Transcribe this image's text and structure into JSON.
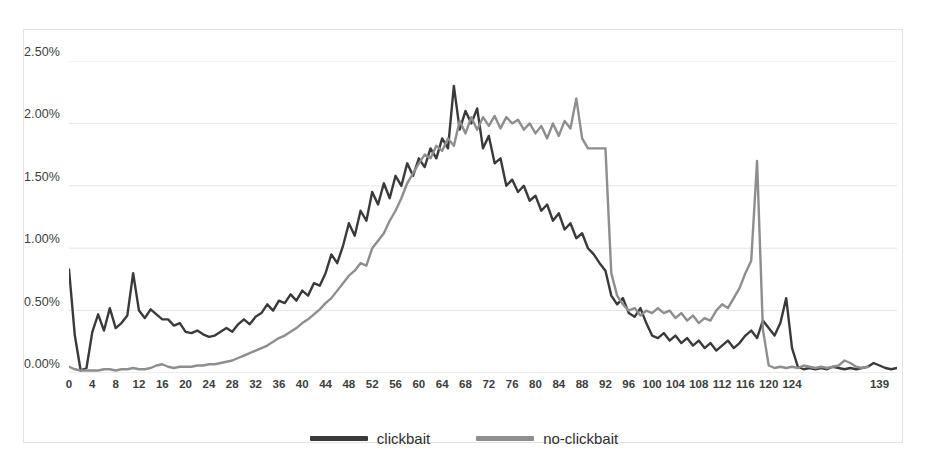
{
  "chart_data": {
    "type": "line",
    "title": "",
    "xlabel": "",
    "ylabel": "",
    "ylim": [
      0,
      2.5
    ],
    "xlim": [
      0,
      139
    ],
    "y_tick_labels": [
      "0.00%",
      "0.50%",
      "1.00%",
      "1.50%",
      "2.00%",
      "2.50%"
    ],
    "y_tick_values": [
      0,
      0.5,
      1.0,
      1.5,
      2.0,
      2.5
    ],
    "x_tick_labels": [
      "0",
      "4",
      "8",
      "12",
      "16",
      "20",
      "24",
      "28",
      "32",
      "36",
      "40",
      "44",
      "48",
      "52",
      "56",
      "60",
      "64",
      "68",
      "72",
      "76",
      "80",
      "84",
      "88",
      "92",
      "96",
      "100",
      "104",
      "108",
      "112",
      "116",
      "120",
      "124",
      "139"
    ],
    "x_tick_values": [
      0,
      4,
      8,
      12,
      16,
      20,
      24,
      28,
      32,
      36,
      40,
      44,
      48,
      52,
      56,
      60,
      64,
      68,
      72,
      76,
      80,
      84,
      88,
      92,
      96,
      100,
      104,
      108,
      112,
      116,
      120,
      124,
      139
    ],
    "grid": true,
    "legend_position": "bottom",
    "colors": {
      "clickbait": "#3a3a3a",
      "no-clickbait": "#8e8e8e"
    },
    "series": [
      {
        "name": "clickbait",
        "color": "#3a3a3a",
        "values": [
          0.83,
          0.3,
          0.02,
          0.04,
          0.33,
          0.47,
          0.34,
          0.52,
          0.36,
          0.4,
          0.46,
          0.8,
          0.5,
          0.44,
          0.51,
          0.47,
          0.43,
          0.43,
          0.38,
          0.4,
          0.33,
          0.32,
          0.34,
          0.31,
          0.29,
          0.3,
          0.33,
          0.36,
          0.33,
          0.39,
          0.43,
          0.39,
          0.45,
          0.48,
          0.55,
          0.5,
          0.58,
          0.56,
          0.63,
          0.58,
          0.66,
          0.62,
          0.72,
          0.7,
          0.8,
          0.95,
          0.88,
          1.02,
          1.2,
          1.1,
          1.3,
          1.22,
          1.45,
          1.35,
          1.52,
          1.4,
          1.58,
          1.5,
          1.68,
          1.58,
          1.72,
          1.65,
          1.8,
          1.72,
          1.88,
          1.8,
          2.3,
          1.95,
          2.1,
          2.0,
          2.12,
          1.8,
          1.9,
          1.68,
          1.72,
          1.5,
          1.55,
          1.45,
          1.5,
          1.38,
          1.42,
          1.3,
          1.35,
          1.22,
          1.28,
          1.15,
          1.2,
          1.08,
          1.12,
          1.0,
          0.95,
          0.88,
          0.82,
          0.62,
          0.55,
          0.6,
          0.48,
          0.45,
          0.52,
          0.4,
          0.3,
          0.28,
          0.32,
          0.26,
          0.3,
          0.24,
          0.28,
          0.22,
          0.26,
          0.2,
          0.24,
          0.18,
          0.22,
          0.26,
          0.2,
          0.24,
          0.3,
          0.34,
          0.28,
          0.42,
          0.36,
          0.3,
          0.4,
          0.6,
          0.2,
          0.05,
          0.03,
          0.04,
          0.03,
          0.04,
          0.03,
          0.05,
          0.04,
          0.03,
          0.04,
          0.03,
          0.04,
          0.05,
          0.08,
          0.06,
          0.04,
          0.03,
          0.04
        ]
      },
      {
        "name": "no-clickbait",
        "color": "#8e8e8e",
        "values": [
          0.05,
          0.03,
          0.02,
          0.02,
          0.02,
          0.02,
          0.03,
          0.03,
          0.02,
          0.03,
          0.03,
          0.04,
          0.03,
          0.03,
          0.04,
          0.06,
          0.07,
          0.05,
          0.04,
          0.05,
          0.05,
          0.05,
          0.06,
          0.06,
          0.07,
          0.07,
          0.08,
          0.09,
          0.1,
          0.12,
          0.14,
          0.16,
          0.18,
          0.2,
          0.22,
          0.25,
          0.28,
          0.3,
          0.33,
          0.36,
          0.4,
          0.43,
          0.47,
          0.51,
          0.56,
          0.6,
          0.66,
          0.72,
          0.78,
          0.82,
          0.88,
          0.86,
          1.0,
          1.06,
          1.12,
          1.22,
          1.3,
          1.4,
          1.52,
          1.6,
          1.68,
          1.75,
          1.72,
          1.82,
          1.78,
          1.88,
          1.82,
          2.02,
          1.92,
          2.05,
          1.95,
          2.05,
          1.98,
          2.06,
          1.96,
          2.05,
          2.0,
          2.03,
          1.95,
          2.0,
          1.92,
          1.98,
          1.88,
          2.0,
          1.9,
          2.02,
          1.96,
          2.2,
          1.88,
          1.8,
          1.8,
          1.8,
          1.8,
          0.8,
          0.62,
          0.55,
          0.5,
          0.52,
          0.46,
          0.5,
          0.48,
          0.52,
          0.48,
          0.5,
          0.44,
          0.48,
          0.42,
          0.46,
          0.4,
          0.44,
          0.42,
          0.5,
          0.55,
          0.52,
          0.6,
          0.68,
          0.8,
          0.9,
          1.7,
          0.35,
          0.06,
          0.04,
          0.05,
          0.04,
          0.05,
          0.04,
          0.06,
          0.05,
          0.04,
          0.05,
          0.04,
          0.05,
          0.06,
          0.1,
          0.08,
          0.05,
          0.04,
          0.05
        ]
      }
    ]
  },
  "legend": {
    "items": [
      {
        "label": "clickbait",
        "color": "#3a3a3a"
      },
      {
        "label": "no-clickbait",
        "color": "#8e8e8e"
      }
    ]
  }
}
